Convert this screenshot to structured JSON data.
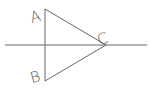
{
  "diagram": {
    "type": "geometry",
    "labels": {
      "a": "A",
      "b": "B",
      "c": "C"
    },
    "points": {
      "A": [
        45,
        9
      ],
      "B": [
        45,
        81
      ],
      "C": [
        106,
        45
      ]
    },
    "axis_line": {
      "x1": 5,
      "y1": 45,
      "x2": 147,
      "y2": 45
    },
    "stroke_color": "#555555"
  }
}
